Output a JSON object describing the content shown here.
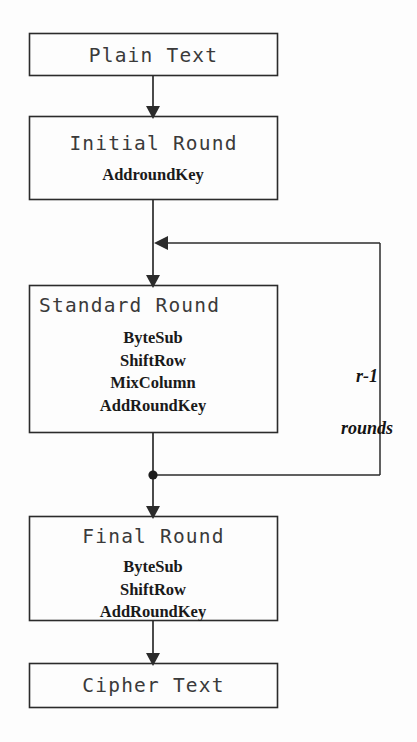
{
  "diagram": {
    "background_color": "#fdfdfd",
    "line_color": "#2b2b2b",
    "text_color": "#262626",
    "nodes": {
      "plain_text": {
        "heading": "Plain Text",
        "operations": []
      },
      "initial_round": {
        "heading": "Initial Round",
        "operations": [
          "AddroundKey"
        ]
      },
      "standard_round": {
        "heading": "Standard Round",
        "operations": [
          "ByteSub",
          "ShiftRow",
          "MixColumn",
          "AddRoundKey"
        ]
      },
      "final_round": {
        "heading": "Final Round",
        "operations": [
          "ByteSub",
          "ShiftRow",
          "AddRoundKey"
        ]
      },
      "cipher_text": {
        "heading": "Cipher Text",
        "operations": []
      }
    },
    "loop": {
      "label_line1": "r-1",
      "label_line2": "rounds"
    }
  }
}
